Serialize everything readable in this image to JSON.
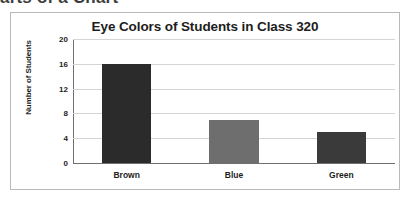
{
  "page": {
    "heading_partial": "arts of a Chart"
  },
  "chart_data": {
    "type": "bar",
    "title": "Eye Colors of Students in Class 320",
    "xlabel": "",
    "ylabel": "Number of Students",
    "categories": [
      "Brown",
      "Blue",
      "Green"
    ],
    "values": [
      16,
      7,
      5
    ],
    "bar_colors": [
      "#2b2b2b",
      "#6e6e6e",
      "#3a3a3a"
    ],
    "ylim": [
      0,
      20
    ],
    "ytick_step": 4,
    "yticks": [
      20,
      16,
      12,
      8,
      4,
      0
    ],
    "grid": "horizontal",
    "legend": "none",
    "frame_border_color": "#b9b9b9",
    "gridline_color": "#d4d4d4",
    "axis_color": "#6f6f6f"
  }
}
